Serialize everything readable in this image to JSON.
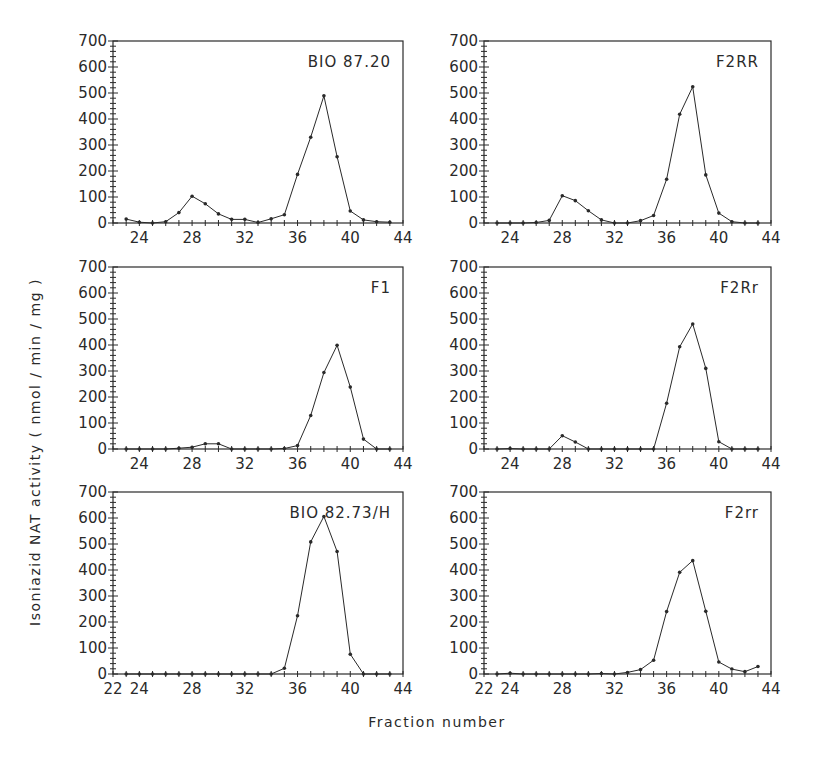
{
  "chart_data": {
    "type": "line",
    "layout": "3x2 grid of small multiples",
    "xlabel": "Fraction number",
    "ylabel": "Isoniazid NAT activity ( nmol / min / mg )",
    "xlim": [
      22,
      44
    ],
    "ylim": [
      0,
      700
    ],
    "yticks": [
      0,
      100,
      200,
      300,
      400,
      500,
      600,
      700
    ],
    "grid": false,
    "x": [
      23,
      24,
      25,
      26,
      27,
      28,
      29,
      30,
      31,
      32,
      33,
      34,
      35,
      36,
      37,
      38,
      39,
      40,
      41,
      42,
      43
    ],
    "panels": [
      {
        "label": "BIO 87.20",
        "xticks": [
          24,
          28,
          32,
          36,
          40,
          44
        ],
        "values": [
          15,
          3,
          0,
          5,
          40,
          103,
          74,
          35,
          14,
          14,
          2,
          16,
          32,
          187,
          330,
          489,
          255,
          46,
          12,
          5,
          3
        ]
      },
      {
        "label": "F2RR",
        "xticks": [
          24,
          28,
          32,
          36,
          40,
          44
        ],
        "values": [
          0,
          0,
          0,
          2,
          10,
          105,
          86,
          47,
          12,
          0,
          0,
          9,
          29,
          168,
          418,
          524,
          185,
          38,
          5,
          0,
          0
        ]
      },
      {
        "label": "F1",
        "xticks": [
          24,
          28,
          32,
          36,
          40,
          44
        ],
        "values": [
          0,
          0,
          0,
          0,
          3,
          7,
          20,
          20,
          0,
          0,
          0,
          0,
          2,
          13,
          129,
          294,
          399,
          238,
          38,
          0,
          0
        ]
      },
      {
        "label": "F2Rr",
        "xticks": [
          24,
          28,
          32,
          36,
          40,
          44
        ],
        "values": [
          0,
          2,
          0,
          0,
          0,
          51,
          27,
          0,
          0,
          0,
          0,
          0,
          0,
          176,
          393,
          481,
          310,
          28,
          0,
          0,
          0
        ]
      },
      {
        "label": "BIO 82.73/H",
        "xticks": [
          22,
          24,
          28,
          32,
          36,
          40,
          44
        ],
        "values": [
          0,
          0,
          0,
          0,
          0,
          0,
          0,
          0,
          0,
          0,
          0,
          0,
          22,
          224,
          508,
          606,
          471,
          76,
          0,
          0,
          0
        ]
      },
      {
        "label": "F2rr",
        "xticks": [
          22,
          24,
          28,
          32,
          36,
          40,
          44
        ],
        "values": [
          0,
          3,
          0,
          0,
          0,
          0,
          0,
          0,
          2,
          0,
          6,
          17,
          53,
          240,
          391,
          436,
          241,
          46,
          19,
          9,
          29
        ]
      }
    ]
  }
}
